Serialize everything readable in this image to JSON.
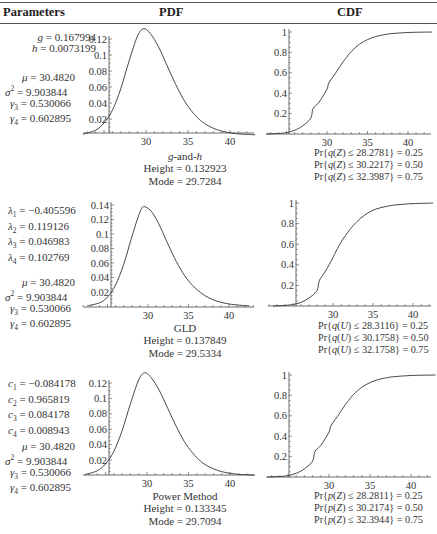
{
  "header": {
    "col_parameters": "Parameters",
    "col_pdf": "PDF",
    "col_cdf": "CDF"
  },
  "rows": [
    {
      "name": "g-and-h",
      "params": [
        {
          "sym": "g",
          "sub": "",
          "sup": "",
          "value": " = 0.167994"
        },
        {
          "sym": "h",
          "sub": "",
          "sup": "",
          "value": " = 0.0073199"
        }
      ],
      "moments": [
        {
          "sym": "μ",
          "sub": "",
          "sup": "",
          "value": " = 30.4820"
        },
        {
          "sym": "σ",
          "sub": "",
          "sup": "2",
          "value": " = 9.903844"
        },
        {
          "sym": "γ",
          "sub": "3",
          "sup": "",
          "value": " = 0.530066"
        },
        {
          "sym": "γ",
          "sub": "4",
          "sup": "",
          "value": " = 0.602895"
        }
      ],
      "pdf_caption": {
        "title_a": "g",
        "title_b": "-and-",
        "title_c": "h",
        "height": "Height = 0.132923",
        "mode": "Mode = 29.7284"
      },
      "cdf_probs": [
        {
          "fn": "q",
          "arg": "Z",
          "text": " ≤ 28.2781} = 0.25"
        },
        {
          "fn": "q",
          "arg": "Z",
          "text": " ≤ 30.2217} = 0.50"
        },
        {
          "fn": "q",
          "arg": "Z",
          "text": " ≤ 32.3987} = 0.75"
        }
      ]
    },
    {
      "name": "GLD",
      "params": [
        {
          "sym": "λ",
          "sub": "1",
          "sup": "",
          "value": " = −0.405596"
        },
        {
          "sym": "λ",
          "sub": "2",
          "sup": "",
          "value": " = 0.119126"
        },
        {
          "sym": "λ",
          "sub": "3",
          "sup": "",
          "value": " = 0.046983"
        },
        {
          "sym": "λ",
          "sub": "4",
          "sup": "",
          "value": " = 0.102769"
        }
      ],
      "moments": [
        {
          "sym": "μ",
          "sub": "",
          "sup": "",
          "value": " = 30.4820"
        },
        {
          "sym": "σ",
          "sub": "",
          "sup": "2",
          "value": " = 9.903844"
        },
        {
          "sym": "γ",
          "sub": "3",
          "sup": "",
          "value": " = 0.530066"
        },
        {
          "sym": "γ",
          "sub": "4",
          "sup": "",
          "value": " = 0.602895"
        }
      ],
      "pdf_caption": {
        "title": "GLD",
        "height": "Height = 0.137849",
        "mode": "Mode = 29.5334"
      },
      "cdf_probs": [
        {
          "fn": "q",
          "arg": "U",
          "text": " ≤ 28.3116} = 0.25"
        },
        {
          "fn": "q",
          "arg": "U",
          "text": " ≤ 30.1758} = 0.50"
        },
        {
          "fn": "q",
          "arg": "U",
          "text": " ≤ 32.1758} = 0.75"
        }
      ]
    },
    {
      "name": "Power Method",
      "params": [
        {
          "sym": "c",
          "sub": "1",
          "sup": "",
          "value": " = −0.084178"
        },
        {
          "sym": "c",
          "sub": "2",
          "sup": "",
          "value": " = 0.965819"
        },
        {
          "sym": "c",
          "sub": "3",
          "sup": "",
          "value": " = 0.084178"
        },
        {
          "sym": "c",
          "sub": "4",
          "sup": "",
          "value": " = 0.008943"
        }
      ],
      "moments": [
        {
          "sym": "μ",
          "sub": "",
          "sup": "",
          "value": " = 30.4820"
        },
        {
          "sym": "σ",
          "sub": "",
          "sup": "2",
          "value": " = 9.903844"
        },
        {
          "sym": "γ",
          "sub": "3",
          "sup": "",
          "value": " = 0.530066"
        },
        {
          "sym": "γ",
          "sub": "4",
          "sup": "",
          "value": " = 0.602895"
        }
      ],
      "pdf_caption": {
        "title": "Power Method",
        "height": "Height = 0.133345",
        "mode": "Mode = 29.7094"
      },
      "cdf_probs": [
        {
          "fn": "p",
          "arg": "Z",
          "text": " ≤ 28.2811} = 0.25"
        },
        {
          "fn": "p",
          "arg": "Z",
          "text": " ≤ 30.2174} = 0.50"
        },
        {
          "fn": "p",
          "arg": "Z",
          "text": " ≤ 32.3944} = 0.75"
        }
      ]
    }
  ],
  "chart_data": [
    {
      "type": "line",
      "title": "g-and-h PDF",
      "xlabel": "",
      "ylabel": "",
      "xlim": [
        22.5,
        43
      ],
      "ylim": [
        0,
        0.14
      ],
      "xticks": [
        "30",
        "35",
        "40"
      ],
      "yticks": [
        "0.02",
        "0.04",
        "0.06",
        "0.08",
        "0.1",
        "0.12"
      ],
      "x": [
        22.5,
        24,
        25,
        26,
        27,
        28,
        29,
        29.73,
        30.5,
        31.5,
        32.5,
        33.5,
        34.5,
        35.5,
        36.5,
        37.5,
        38.5,
        39.5,
        40.5,
        41.5,
        43
      ],
      "values": [
        0.001,
        0.006,
        0.015,
        0.031,
        0.058,
        0.093,
        0.124,
        0.1329,
        0.127,
        0.11,
        0.087,
        0.064,
        0.044,
        0.029,
        0.018,
        0.011,
        0.0065,
        0.0037,
        0.002,
        0.001,
        0.0003
      ],
      "height": 0.132923,
      "mode": 29.7284
    },
    {
      "type": "line",
      "title": "g-and-h CDF",
      "xlabel": "",
      "ylabel": "",
      "xlim": [
        22.5,
        43
      ],
      "ylim": [
        0,
        1
      ],
      "xticks": [
        "30",
        "35",
        "40"
      ],
      "yticks": [
        "0.2",
        "0.4",
        "0.6",
        "0.8",
        "1"
      ],
      "x": [
        22.5,
        24,
        25,
        26,
        27,
        28,
        28.28,
        29,
        30,
        30.22,
        31,
        32,
        32.4,
        33,
        34,
        35,
        36,
        37,
        38,
        40,
        43
      ],
      "values": [
        0.0,
        0.005,
        0.014,
        0.036,
        0.08,
        0.155,
        0.25,
        0.31,
        0.44,
        0.5,
        0.59,
        0.71,
        0.75,
        0.81,
        0.88,
        0.925,
        0.955,
        0.973,
        0.984,
        0.995,
        1.0
      ]
    },
    {
      "type": "line",
      "title": "GLD PDF",
      "xlabel": "",
      "ylabel": "",
      "xlim": [
        22.5,
        42.5
      ],
      "ylim": [
        0,
        0.15
      ],
      "xticks": [
        "30",
        "35",
        "40"
      ],
      "yticks": [
        "0.02",
        "0.04",
        "0.06",
        "0.08",
        "0.1",
        "0.12",
        "0.14"
      ],
      "x": [
        22.5,
        24,
        25,
        26,
        27,
        28,
        29,
        29.53,
        30.5,
        31.5,
        32.5,
        33.5,
        34.5,
        35.5,
        36.5,
        37.5,
        38.5,
        39.5,
        40.5,
        41.5,
        42.5
      ],
      "values": [
        0.001,
        0.005,
        0.013,
        0.03,
        0.058,
        0.096,
        0.13,
        0.1378,
        0.13,
        0.11,
        0.085,
        0.062,
        0.043,
        0.029,
        0.019,
        0.012,
        0.0075,
        0.0045,
        0.0027,
        0.0015,
        0.0008
      ],
      "height": 0.137849,
      "mode": 29.5334
    },
    {
      "type": "line",
      "title": "GLD CDF",
      "xlabel": "",
      "ylabel": "",
      "xlim": [
        22.5,
        42.5
      ],
      "ylim": [
        0,
        1
      ],
      "xticks": [
        "30",
        "35",
        "40"
      ],
      "yticks": [
        "0.2",
        "0.4",
        "0.6",
        "0.8",
        "1"
      ],
      "x": [
        22.5,
        24,
        25,
        26,
        27,
        28,
        28.31,
        29,
        30,
        30.18,
        31,
        32,
        32.18,
        33,
        34,
        35,
        36,
        37,
        38,
        40,
        42.5
      ],
      "values": [
        0.0,
        0.006,
        0.015,
        0.035,
        0.078,
        0.15,
        0.25,
        0.33,
        0.47,
        0.5,
        0.62,
        0.73,
        0.75,
        0.82,
        0.885,
        0.93,
        0.955,
        0.972,
        0.983,
        0.994,
        0.999
      ]
    },
    {
      "type": "line",
      "title": "Power Method PDF",
      "xlabel": "",
      "ylabel": "",
      "xlim": [
        22.5,
        43
      ],
      "ylim": [
        0,
        0.14
      ],
      "xticks": [
        "30",
        "35",
        "40"
      ],
      "yticks": [
        "0.02",
        "0.04",
        "0.06",
        "0.08",
        "0.1",
        "0.12"
      ],
      "x": [
        22.5,
        24,
        25,
        26,
        27,
        28,
        29,
        29.71,
        30.5,
        31.5,
        32.5,
        33.5,
        34.5,
        35.5,
        36.5,
        37.5,
        38.5,
        39.5,
        40.5,
        41.5,
        43
      ],
      "values": [
        0.001,
        0.006,
        0.015,
        0.031,
        0.058,
        0.093,
        0.124,
        0.1333,
        0.127,
        0.11,
        0.087,
        0.064,
        0.044,
        0.029,
        0.018,
        0.011,
        0.0065,
        0.0037,
        0.002,
        0.001,
        0.0003
      ],
      "height": 0.133345,
      "mode": 29.7094
    },
    {
      "type": "line",
      "title": "Power Method CDF",
      "xlabel": "",
      "ylabel": "",
      "xlim": [
        22.5,
        43
      ],
      "ylim": [
        0,
        1
      ],
      "xticks": [
        "30",
        "35",
        "40"
      ],
      "yticks": [
        "0.2",
        "0.4",
        "0.6",
        "0.8",
        "1"
      ],
      "x": [
        22.5,
        24,
        25,
        26,
        27,
        28,
        28.28,
        29,
        30,
        30.22,
        31,
        32,
        32.39,
        33,
        34,
        35,
        36,
        37,
        38,
        40,
        43
      ],
      "values": [
        0.0,
        0.005,
        0.014,
        0.036,
        0.08,
        0.155,
        0.25,
        0.31,
        0.44,
        0.5,
        0.59,
        0.71,
        0.75,
        0.81,
        0.88,
        0.925,
        0.955,
        0.973,
        0.984,
        0.995,
        1.0
      ]
    }
  ]
}
